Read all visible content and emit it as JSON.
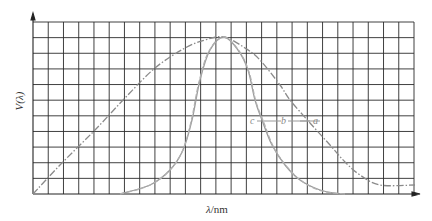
{
  "chart_data": {
    "type": "line",
    "title": "",
    "xlabel": "λ/nm",
    "ylabel": "V(λ)",
    "grid": true,
    "grid_cols": 25,
    "grid_rows": 11,
    "axis_ticks_labeled": false,
    "legend_position": "inside-right-middle",
    "legend": [
      "c",
      "b",
      "a"
    ],
    "series": [
      {
        "name": "a",
        "style": "dash-dot",
        "description": "broad curve",
        "points_px": [
          [
            33,
            194
          ],
          [
            60,
            165
          ],
          [
            95,
            130
          ],
          [
            125,
            98
          ],
          [
            155,
            68
          ],
          [
            185,
            48
          ],
          [
            205,
            40
          ],
          [
            224,
            37
          ],
          [
            245,
            48
          ],
          [
            260,
            60
          ],
          [
            280,
            85
          ],
          [
            290,
            100
          ],
          [
            310,
            123
          ],
          [
            330,
            145
          ],
          [
            345,
            162
          ],
          [
            360,
            175
          ],
          [
            380,
            185
          ],
          [
            415,
            185
          ]
        ]
      },
      {
        "name": "b",
        "style": "solid",
        "description": "narrow curve",
        "points_px": [
          [
            120,
            194
          ],
          [
            150,
            185
          ],
          [
            170,
            170
          ],
          [
            183,
            150
          ],
          [
            192,
            120
          ],
          [
            200,
            80
          ],
          [
            210,
            50
          ],
          [
            224,
            37
          ],
          [
            238,
            50
          ],
          [
            248,
            70
          ],
          [
            255,
            100
          ],
          [
            262,
            120
          ],
          [
            272,
            145
          ],
          [
            285,
            165
          ],
          [
            300,
            180
          ],
          [
            320,
            190
          ],
          [
            340,
            194
          ]
        ]
      },
      {
        "name": "c",
        "style": "dashed",
        "description": "narrow curve (close to b)",
        "points_px": [
          [
            120,
            194
          ],
          [
            148,
            186
          ],
          [
            168,
            172
          ],
          [
            182,
            152
          ],
          [
            191,
            122
          ],
          [
            199,
            82
          ],
          [
            209,
            51
          ],
          [
            224,
            37
          ],
          [
            239,
            51
          ],
          [
            249,
            72
          ],
          [
            256,
            102
          ],
          [
            264,
            123
          ],
          [
            274,
            148
          ],
          [
            288,
            168
          ],
          [
            303,
            182
          ],
          [
            322,
            191
          ],
          [
            345,
            194
          ]
        ]
      }
    ],
    "peak": {
      "x_px": 224,
      "y_px": 37,
      "value": 1.0
    }
  },
  "labels": {
    "xlabel_var": "λ",
    "xlabel_unit": "/nm",
    "ylabel": "V(λ)",
    "legend_c": "c",
    "legend_b": "b",
    "legend_a": "a"
  }
}
